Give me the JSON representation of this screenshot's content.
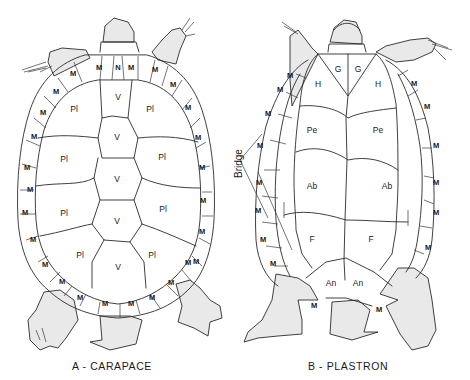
{
  "figure": {
    "captions": {
      "carapace": "A - CARAPACE",
      "plastron": "B - PLASTRON"
    },
    "annotations": {
      "bridge": "Bridge"
    },
    "colors": {
      "line": "#2a2a2a",
      "stipple": "#e9e9e9",
      "background": "#ffffff"
    }
  },
  "carapace": {
    "nuchal": "N",
    "vertebrals": [
      "V",
      "V",
      "V",
      "V",
      "V"
    ],
    "pleurals_left": [
      "Pl",
      "Pl",
      "Pl",
      "Pl"
    ],
    "pleurals_right": [
      "Pl",
      "Pl",
      "Pl",
      "Pl"
    ],
    "marginal": "M"
  },
  "plastron": {
    "gulars": [
      "G",
      "G"
    ],
    "humerals": [
      "H",
      "H"
    ],
    "pectorals": [
      "Pe",
      "Pe"
    ],
    "abdominals": [
      "Ab",
      "Ab"
    ],
    "femorals": [
      "F",
      "F"
    ],
    "anals": [
      "An",
      "An"
    ],
    "marginal": "M"
  }
}
